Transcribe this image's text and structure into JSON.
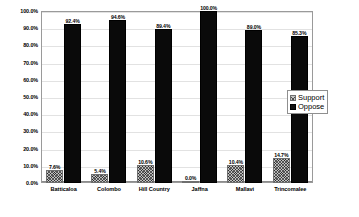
{
  "chart_data": {
    "type": "bar",
    "title": "",
    "subtitle": "",
    "xlabel": "",
    "ylabel": "",
    "ylim": [
      0,
      100
    ],
    "grid": true,
    "legend_position": "right",
    "categories": [
      "Batticaloa",
      "Colombo",
      "Hill Country",
      "Jaffna",
      "Mallavi",
      "Trincomalee"
    ],
    "ytick_labels": [
      "100.0%",
      "90.0%",
      "80.0%",
      "70.0%",
      "60.0%",
      "50.0%",
      "40.0%",
      "30.0%",
      "20.0%",
      "10.0%",
      "0.0%"
    ],
    "ytick_values": [
      100,
      90,
      80,
      70,
      60,
      50,
      40,
      30,
      20,
      10,
      0
    ],
    "series": [
      {
        "name": "Support",
        "color": "#bfbfbf",
        "pattern": "crosshatch",
        "values": [
          7.6,
          5.4,
          10.6,
          0.0,
          10.4,
          14.7
        ],
        "labels": [
          "7.6%",
          "5.4%",
          "10.6%",
          "0.0%",
          "10.4%",
          "14.7%"
        ]
      },
      {
        "name": "Oppose",
        "color": "#0a0a0a",
        "pattern": "solid",
        "values": [
          92.4,
          94.6,
          89.4,
          100.0,
          89.0,
          85.3
        ],
        "labels": [
          "92.4%",
          "94.6%",
          "89.4%",
          "100.0%",
          "89.0%",
          "85.3%"
        ]
      }
    ]
  },
  "legend": {
    "items": [
      {
        "label": "Support",
        "swatch": "support"
      },
      {
        "label": "Oppose",
        "swatch": "oppose"
      }
    ]
  }
}
